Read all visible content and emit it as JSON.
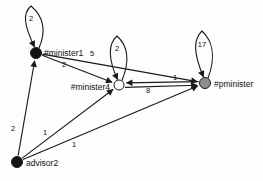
{
  "diagram": {
    "background": "#fdfdfd",
    "stroke_color": "#1a1a1a",
    "label_color": "#111111",
    "nodes": [
      {
        "id": "minister1",
        "label": "#minister1",
        "x": 36,
        "y": 53,
        "r": 5.5,
        "fill": "#111111",
        "label_x": 44,
        "label_y": 56,
        "label_anchor": "start"
      },
      {
        "id": "minister4",
        "label": "#minister4",
        "x": 119,
        "y": 85,
        "r": 5,
        "fill": "#ffffff",
        "label_x": 110,
        "label_y": 90,
        "label_anchor": "end"
      },
      {
        "id": "pminister",
        "label": "#pminister",
        "x": 205,
        "y": 83,
        "r": 5.5,
        "fill": "#8f8f8f",
        "label_x": 214,
        "label_y": 87,
        "label_anchor": "start"
      },
      {
        "id": "advisor2",
        "label": "advisor2",
        "x": 17,
        "y": 162,
        "r": 5.5,
        "fill": "#141414",
        "label_x": 26,
        "label_y": 166,
        "label_anchor": "start"
      }
    ],
    "edges": [
      {
        "from": "minister1",
        "to": "minister4",
        "label": "2",
        "lx": 64,
        "ly": 67,
        "dy1": 0,
        "dy2": 0
      },
      {
        "from": "minister1",
        "to": "pminister",
        "label": "5",
        "lx": 92,
        "ly": 56,
        "dy1": 0,
        "dy2": 0
      },
      {
        "from": "minister4",
        "to": "pminister",
        "label": "8",
        "lx": 148,
        "ly": 93,
        "dy1": 2.5,
        "dy2": 2
      },
      {
        "from": "pminister",
        "to": "minister4",
        "label": "1",
        "lx": 175,
        "ly": 80,
        "dy1": -1.5,
        "dy2": -2
      },
      {
        "from": "advisor2",
        "to": "minister1",
        "label": "2",
        "lx": 13,
        "ly": 131,
        "dy1": 0,
        "dy2": 0
      },
      {
        "from": "advisor2",
        "to": "minister4",
        "label": "1",
        "lx": 45,
        "ly": 135,
        "dy1": 0,
        "dy2": 0
      },
      {
        "from": "advisor2",
        "to": "pminister",
        "label": "1",
        "lx": 74,
        "ly": 147,
        "dy1": 0,
        "dy2": 0
      }
    ],
    "self_loops": [
      {
        "node": "minister1",
        "label": "2",
        "apex_x": 31,
        "apex_y": 6,
        "label_x": 31,
        "label_y": 21
      },
      {
        "node": "minister4",
        "label": "2",
        "apex_x": 117,
        "apex_y": 36,
        "label_x": 117,
        "label_y": 51
      },
      {
        "node": "pminister",
        "label": "17",
        "apex_x": 202,
        "apex_y": 31,
        "label_x": 202,
        "label_y": 47
      }
    ]
  }
}
